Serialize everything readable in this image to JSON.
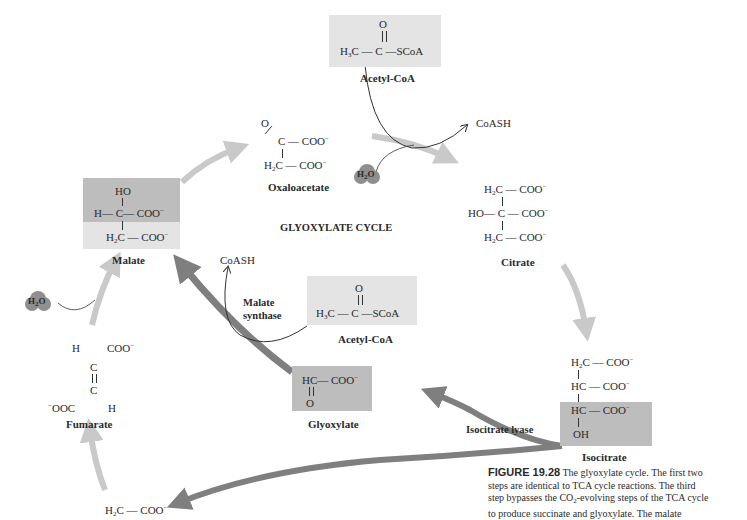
{
  "title": "GLYOXYLATE CYCLE",
  "colors": {
    "tca_arrow": "#c9c9c9",
    "glyoxylate_arrow": "#7f7f7f",
    "box_light": "#e4e4e4",
    "box_dark": "#bdbdbd",
    "water": "#8f8f8f"
  },
  "compounds": {
    "acetyl_coa_top": {
      "name": "Acetyl-CoA",
      "o": "O",
      "left": "H",
      "left_sub": "3",
      "left2": "C",
      "c": "C",
      "right": "SCoA"
    },
    "oxaloacetate": {
      "name": "Oxaloacetate",
      "o": "O",
      "row1_c": "C",
      "row1_r": "COO",
      "row2_l": "H",
      "row2_sub": "2",
      "row2_c": "C",
      "row2_r": "COO"
    },
    "citrate": {
      "name": "Citrate",
      "r1_l": "H",
      "r1_sub": "2",
      "r1_c": "C",
      "r1_r": "COO",
      "r2_l": "HO",
      "r2_c": "C",
      "r2_r": "COO",
      "r3_l": "H",
      "r3_sub": "2",
      "r3_c": "C",
      "r3_r": "COO"
    },
    "isocitrate": {
      "name": "Isocitrate",
      "r1": "H",
      "r1_sub": "2",
      "r1_c": "C",
      "r1_r": "COO",
      "r2": "HC",
      "r2_r": "COO",
      "r3": "HC",
      "r3_r": "COO",
      "r4": "OH"
    },
    "malate": {
      "name": "Malate",
      "ho": "HO",
      "r1_l": "H",
      "r1_c": "C",
      "r1_r": "COO",
      "r2_l": "H",
      "r2_sub": "2",
      "r2_c": "C",
      "r2_r": "COO"
    },
    "fumarate": {
      "name": "Fumarate",
      "h1": "H",
      "coo1": "COO",
      "c1": "C",
      "c2": "C",
      "coo2": "OOC",
      "h2": "H"
    },
    "glyoxylate": {
      "name": "Glyoxylate",
      "hc": "HC",
      "coo": "COO",
      "o": "O"
    },
    "acetyl_coa_mid": {
      "name": "Acetyl-CoA",
      "o": "O",
      "left": "H",
      "left_sub": "3",
      "left2": "C",
      "c": "C",
      "right": "SCoA"
    },
    "succinate_partial": {
      "l": "H",
      "sub": "2",
      "c": "C",
      "r": "COO"
    }
  },
  "small_labels": {
    "coash_top": "CoASH",
    "coash_mid": "CoASH",
    "water_top": {
      "h": "H",
      "sub": "2",
      "o": "O"
    },
    "water_left": {
      "h": "H",
      "sub": "2",
      "o": "O"
    },
    "minus": "−",
    "bond": "—"
  },
  "enzymes": {
    "malate_synthase_1": "Malate",
    "malate_synthase_2": "synthase",
    "isocitrate_lyase": "Isocitrate lyase"
  },
  "caption": {
    "label": "FIGURE 19.28",
    "lines": [
      " The glyoxylate cycle. The first two",
      "steps are identical to TCA cycle reactions. The third",
      "step bypasses the CO",
      "-evolving steps of the TCA cycle",
      "to produce succinate and glyoxylate. The malate"
    ],
    "co2_sub": "2"
  }
}
